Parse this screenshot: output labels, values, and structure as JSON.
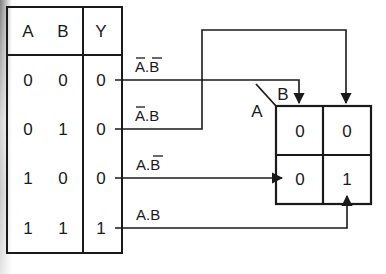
{
  "truth_table": {
    "headers": [
      "A",
      "B",
      "Y"
    ],
    "rows": [
      {
        "A": "0",
        "B": "0",
        "Y": "0"
      },
      {
        "A": "0",
        "B": "1",
        "Y": "0"
      },
      {
        "A": "1",
        "B": "0",
        "Y": "0"
      },
      {
        "A": "1",
        "B": "1",
        "Y": "1"
      }
    ]
  },
  "minterms": [
    {
      "label": "A.B",
      "a_bar": true,
      "b_bar": true
    },
    {
      "label": "A.B",
      "a_bar": true,
      "b_bar": false
    },
    {
      "label": "A.B",
      "a_bar": false,
      "b_bar": true
    },
    {
      "label": "A.B",
      "a_bar": false,
      "b_bar": false
    }
  ],
  "kmap": {
    "row_var": "A",
    "col_var": "B",
    "cells": [
      [
        "0",
        "0"
      ],
      [
        "0",
        "1"
      ]
    ]
  },
  "colors": {
    "line": "#1a1a1a",
    "background": "#ffffff"
  }
}
